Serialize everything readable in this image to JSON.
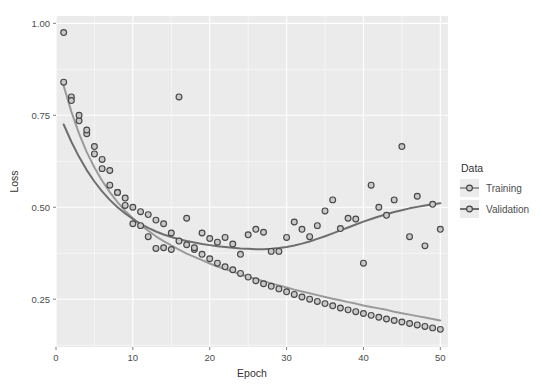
{
  "chart_data": {
    "type": "scatter",
    "title": "",
    "xlabel": "Epoch",
    "ylabel": "Loss",
    "xlim": [
      0,
      51
    ],
    "ylim": [
      0.12,
      1.02
    ],
    "xticks": [
      0,
      10,
      20,
      30,
      40,
      50
    ],
    "xtick_labels": [
      "0",
      "10",
      "20",
      "30",
      "40",
      "50"
    ],
    "yticks": [
      0.25,
      0.5,
      0.75,
      1.0
    ],
    "ytick_labels": [
      "0.25",
      "0.50",
      "0.75",
      "1.00"
    ],
    "grid": true,
    "grid_color": "#ffffff",
    "panel_background": "#ebebeb",
    "legend_position": "right",
    "legend_title": "Data",
    "series": [
      {
        "name": "Training",
        "color": "#9a9a9a",
        "marker": "circle",
        "has_smooth_line": true,
        "x": [
          1,
          2,
          3,
          4,
          5,
          6,
          7,
          8,
          9,
          10,
          11,
          12,
          13,
          14,
          15,
          16,
          17,
          18,
          19,
          20,
          21,
          22,
          23,
          24,
          25,
          26,
          27,
          28,
          29,
          30,
          31,
          32,
          33,
          34,
          35,
          36,
          37,
          38,
          39,
          40,
          41,
          42,
          43,
          44,
          45,
          46,
          47,
          48,
          49,
          50
        ],
        "y": [
          0.975,
          0.8,
          0.735,
          0.7,
          0.645,
          0.605,
          0.6,
          0.54,
          0.525,
          0.5,
          0.488,
          0.48,
          0.465,
          0.455,
          0.43,
          0.408,
          0.398,
          0.385,
          0.372,
          0.36,
          0.348,
          0.338,
          0.33,
          0.32,
          0.31,
          0.3,
          0.292,
          0.285,
          0.278,
          0.27,
          0.263,
          0.256,
          0.25,
          0.244,
          0.238,
          0.232,
          0.226,
          0.221,
          0.216,
          0.211,
          0.206,
          0.201,
          0.196,
          0.192,
          0.188,
          0.184,
          0.18,
          0.176,
          0.172,
          0.168
        ],
        "smooth_y": [
          0.83,
          0.76,
          0.7,
          0.65,
          0.608,
          0.572,
          0.541,
          0.514,
          0.49,
          0.47,
          0.452,
          0.436,
          0.421,
          0.408,
          0.396,
          0.385,
          0.374,
          0.365,
          0.356,
          0.347,
          0.339,
          0.332,
          0.325,
          0.318,
          0.311,
          0.305,
          0.299,
          0.293,
          0.287,
          0.282,
          0.276,
          0.271,
          0.266,
          0.261,
          0.256,
          0.251,
          0.247,
          0.242,
          0.238,
          0.233,
          0.229,
          0.225,
          0.221,
          0.216,
          0.212,
          0.208,
          0.204,
          0.2,
          0.196,
          0.192
        ]
      },
      {
        "name": "Validation",
        "color": "#6e6e6e",
        "marker": "circle",
        "has_smooth_line": true,
        "x": [
          1,
          2,
          3,
          4,
          5,
          6,
          7,
          8,
          9,
          10,
          11,
          12,
          13,
          14,
          15,
          16,
          17,
          18,
          19,
          20,
          21,
          22,
          23,
          24,
          25,
          26,
          27,
          28,
          29,
          30,
          31,
          32,
          33,
          34,
          35,
          36,
          37,
          38,
          39,
          40,
          41,
          42,
          43,
          44,
          45,
          46,
          47,
          48,
          49,
          50
        ],
        "y": [
          0.84,
          0.79,
          0.75,
          0.71,
          0.665,
          0.63,
          0.56,
          0.54,
          0.505,
          0.455,
          0.45,
          0.42,
          0.388,
          0.39,
          0.385,
          0.8,
          0.47,
          0.39,
          0.43,
          0.415,
          0.405,
          0.418,
          0.4,
          0.372,
          0.425,
          0.44,
          0.432,
          0.38,
          0.38,
          0.418,
          0.46,
          0.44,
          0.42,
          0.45,
          0.49,
          0.52,
          0.442,
          0.47,
          0.468,
          0.348,
          0.56,
          0.5,
          0.478,
          0.52,
          0.665,
          0.42,
          0.53,
          0.395,
          0.508,
          0.44
        ],
        "smooth_y": [
          0.725,
          0.678,
          0.637,
          0.601,
          0.57,
          0.543,
          0.52,
          0.5,
          0.483,
          0.468,
          0.455,
          0.444,
          0.434,
          0.426,
          0.419,
          0.413,
          0.408,
          0.404,
          0.4,
          0.397,
          0.394,
          0.392,
          0.39,
          0.388,
          0.387,
          0.386,
          0.386,
          0.387,
          0.389,
          0.392,
          0.396,
          0.401,
          0.407,
          0.414,
          0.421,
          0.429,
          0.437,
          0.445,
          0.453,
          0.461,
          0.468,
          0.475,
          0.481,
          0.487,
          0.492,
          0.497,
          0.501,
          0.505,
          0.508,
          0.511
        ]
      }
    ]
  },
  "legend": {
    "title": "Data",
    "items": [
      {
        "label": "Training",
        "color": "#9a9a9a"
      },
      {
        "label": "Validation",
        "color": "#6e6e6e"
      }
    ]
  },
  "axes": {
    "x_title": "Epoch",
    "y_title": "Loss"
  }
}
